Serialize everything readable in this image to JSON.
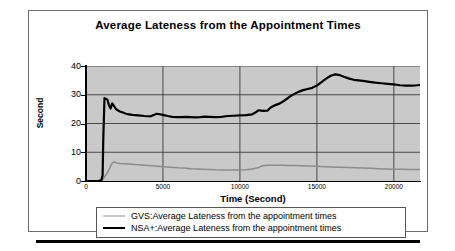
{
  "chart_data": {
    "type": "line",
    "title": "Average Lateness from the Appointment Times",
    "xlabel": "Time (Second)",
    "ylabel": "Second",
    "xlim": [
      0,
      21700
    ],
    "ylim": [
      0,
      40
    ],
    "xticks": [
      "0",
      "5000",
      "10000",
      "15000",
      "20000"
    ],
    "xtick_values": [
      0,
      5000,
      10000,
      15000,
      20000
    ],
    "yticks": [
      "0",
      "10",
      "20",
      "30",
      "40"
    ],
    "ytick_values": [
      0,
      10,
      20,
      30,
      40
    ],
    "grid": true,
    "legend_position": "below-plot",
    "plot_background": "#c9c9c9",
    "series": [
      {
        "name": "GVS:Average Lateness from the appointment times",
        "color": "#8c8c8c",
        "width": 1.5,
        "x": [
          0,
          400,
          800,
          1000,
          1100,
          1200,
          1400,
          1600,
          1700,
          1800,
          1900,
          2000,
          2200,
          2500,
          2800,
          3200,
          3600,
          4000,
          4500,
          5000,
          5500,
          6000,
          6400,
          6800,
          7200,
          7600,
          8000,
          8400,
          8800,
          9200,
          9600,
          10000,
          10400,
          10800,
          11000,
          11200,
          11400,
          11600,
          11800,
          12000,
          12400,
          12800,
          13200,
          13600,
          14000,
          14500,
          15000,
          15500,
          16000,
          16500,
          17000,
          17500,
          18000,
          18500,
          19000,
          19500,
          20000,
          20500,
          21000,
          21500,
          21700
        ],
        "y": [
          0,
          0,
          0,
          0.2,
          0.6,
          1.4,
          3.0,
          5.2,
          6.2,
          6.6,
          6.5,
          6.3,
          6.1,
          6.0,
          5.9,
          5.7,
          5.6,
          5.4,
          5.2,
          5.0,
          4.8,
          4.6,
          4.5,
          4.3,
          4.2,
          4.1,
          4.0,
          3.9,
          3.85,
          3.8,
          3.8,
          3.8,
          3.9,
          4.2,
          4.4,
          4.6,
          5.2,
          5.4,
          5.5,
          5.5,
          5.5,
          5.5,
          5.4,
          5.4,
          5.3,
          5.2,
          5.1,
          5.0,
          4.9,
          4.8,
          4.7,
          4.6,
          4.5,
          4.4,
          4.3,
          4.2,
          4.1,
          4.05,
          4.0,
          4.0,
          4.0
        ]
      },
      {
        "name": "NSA+:Average Lateness from the appointment times",
        "color": "#000000",
        "width": 2.2,
        "x": [
          0,
          400,
          800,
          1000,
          1080,
          1120,
          1200,
          1300,
          1400,
          1500,
          1600,
          1700,
          1800,
          1900,
          2000,
          2200,
          2400,
          2600,
          2800,
          3000,
          3400,
          3800,
          4200,
          4600,
          5000,
          5300,
          5600,
          5900,
          6200,
          6500,
          6800,
          7100,
          7400,
          7700,
          8000,
          8400,
          8800,
          9200,
          9600,
          10000,
          10400,
          10800,
          11000,
          11200,
          11500,
          11800,
          12000,
          12300,
          12600,
          12900,
          13200,
          13500,
          13800,
          14100,
          14400,
          14700,
          15000,
          15300,
          15600,
          15900,
          16200,
          16500,
          16800,
          17100,
          17400,
          17700,
          18000,
          18400,
          18800,
          19200,
          19600,
          20000,
          20400,
          20800,
          21200,
          21500,
          21700
        ],
        "y": [
          0,
          0,
          0,
          0.3,
          2.0,
          14.0,
          28.8,
          28.6,
          28.2,
          26.2,
          25.2,
          27.0,
          26.2,
          25.4,
          24.8,
          24.2,
          23.8,
          23.4,
          23.2,
          23.0,
          22.8,
          22.6,
          22.5,
          23.4,
          23.0,
          22.6,
          22.3,
          22.2,
          22.2,
          22.3,
          22.2,
          22.1,
          22.2,
          22.4,
          22.3,
          22.2,
          22.3,
          22.6,
          22.7,
          22.8,
          22.9,
          23.2,
          23.8,
          24.6,
          24.4,
          24.5,
          25.6,
          26.4,
          27.0,
          28.0,
          29.2,
          30.2,
          31.0,
          31.6,
          32.0,
          32.4,
          33.2,
          34.4,
          35.6,
          36.6,
          37.1,
          36.8,
          36.2,
          35.6,
          35.2,
          35.0,
          34.8,
          34.5,
          34.2,
          34.0,
          33.8,
          33.6,
          33.3,
          33.2,
          33.2,
          33.3,
          33.4
        ]
      }
    ]
  },
  "legend": {
    "items": [
      {
        "label": "GVS:Average Lateness from the appointment times"
      },
      {
        "label": "NSA+:Average Lateness from the appointment times"
      }
    ]
  }
}
